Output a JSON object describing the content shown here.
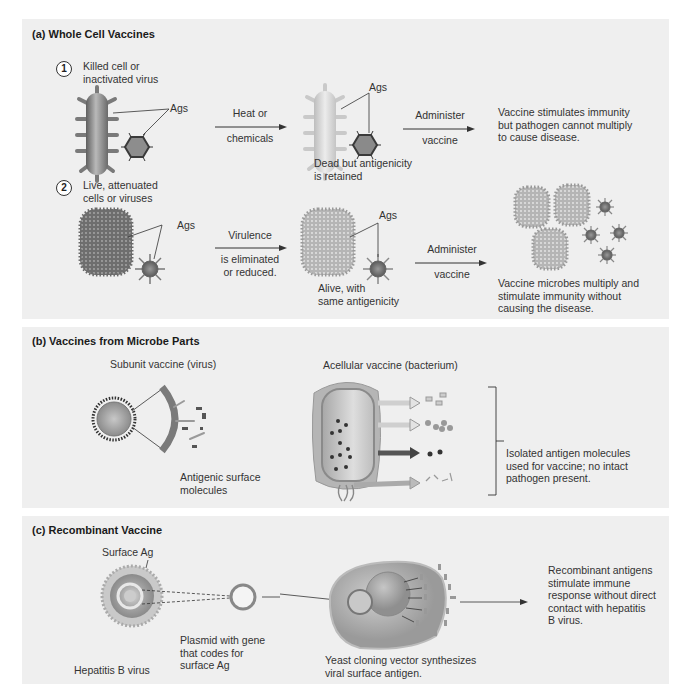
{
  "panel_a": {
    "title": "(a) Whole Cell Vaccines",
    "step1": {
      "number": "1",
      "label": "Killed cell or\ninactivated virus",
      "ags_label_1": "Ags",
      "arrow1_top": "Heat or",
      "arrow1_bottom": "chemicals",
      "ags_label_2": "Ags",
      "mid_caption": "Dead but antigenicity\nis retained",
      "arrow2_top": "Administer",
      "arrow2_bottom": "vaccine",
      "result": "Vaccine stimulates immunity\nbut pathogen cannot multiply\nto cause disease."
    },
    "step2": {
      "number": "2",
      "label": "Live, attenuated\ncells or viruses",
      "ags_label_1": "Ags",
      "arrow1_top": "Virulence",
      "arrow1_bottom": "is eliminated\nor reduced.",
      "ags_label_2": "Ags",
      "mid_caption": "Alive, with\nsame antigenicity",
      "arrow2_top": "Administer",
      "arrow2_bottom": "vaccine",
      "result": "Vaccine microbes multiply and\nstimulate immunity without\ncausing the disease."
    }
  },
  "panel_b": {
    "title": "(b) Vaccines from Microbe Parts",
    "subunit_label": "Subunit vaccine (virus)",
    "subunit_caption": "Antigenic surface\nmolecules",
    "acellular_label": "Acellular vaccine (bacterium)",
    "bracket_caption": "Isolated antigen molecules\nused for vaccine; no intact\npathogen present."
  },
  "panel_c": {
    "title": "(c) Recombinant Vaccine",
    "surface_ag_label": "Surface Ag",
    "virus_caption": "Hepatitis B virus",
    "plasmid_caption": "Plasmid with gene\nthat codes for\nsurface Ag",
    "yeast_caption": "Yeast cloning vector synthesizes\nviral surface antigen.",
    "result": "Recombinant antigens\nstimulate immune\nresponse without direct\ncontact with hepatitis\nB virus."
  },
  "colors": {
    "panel_bg": "#efefef",
    "page_bg": "#ffffff",
    "cell_gray": "#8a8a8a",
    "text": "#333333"
  }
}
